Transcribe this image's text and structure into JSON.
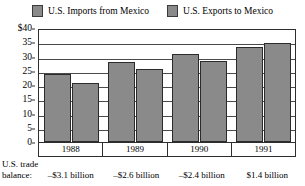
{
  "chart_data": {
    "type": "bar",
    "title": "",
    "xlabel": "",
    "ylabel": "",
    "categories": [
      "1988",
      "1989",
      "1990",
      "1991"
    ],
    "series": [
      {
        "name": "U.S. Imports from Mexico",
        "values": [
          24.0,
          28.1,
          31.0,
          33.3
        ],
        "color": "#8a8a8a"
      },
      {
        "name": "U.S. Exports to Mexico",
        "values": [
          20.8,
          25.5,
          28.6,
          34.7
        ],
        "color": "#8a8a8a"
      }
    ],
    "ylim": [
      0,
      40
    ],
    "y_ticks": [
      "$40",
      "35",
      "30",
      "25",
      "20",
      "15",
      "10",
      "5",
      "0"
    ],
    "y_tick_values": [
      40,
      35,
      30,
      25,
      20,
      15,
      10,
      5,
      0
    ],
    "grid": true,
    "legend_position": "top",
    "units": "billions of U.S. dollars",
    "annotations": {
      "balance_caption_line1": "U.S. trade",
      "balance_caption_line2": "balance:",
      "balance_values": [
        "–$3.1 billion",
        "–$2.6 billion",
        "–$2.4 billion",
        "$1.4 billion"
      ]
    }
  },
  "legend": {
    "entries": [
      {
        "label": "U.S. Imports from Mexico"
      },
      {
        "label": "U.S. Exports to Mexico"
      }
    ]
  }
}
